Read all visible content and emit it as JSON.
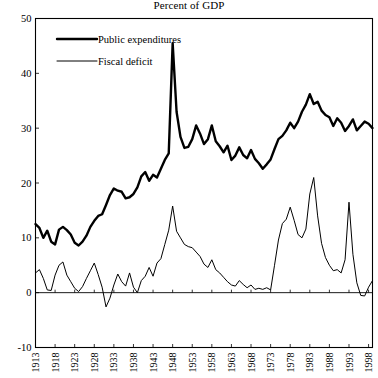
{
  "chart_data": {
    "type": "line",
    "title": "Percent of GDP",
    "xlabel": "",
    "ylabel": "",
    "ylim": [
      -10,
      50
    ],
    "xlim": [
      1913,
      1999
    ],
    "yticks": [
      50,
      40,
      30,
      20,
      10,
      0,
      -10
    ],
    "xticks": [
      1913,
      1918,
      1923,
      1928,
      1933,
      1938,
      1943,
      1948,
      1953,
      1958,
      1963,
      1968,
      1973,
      1978,
      1983,
      1988,
      1993,
      1998
    ],
    "grid": false,
    "zero_line": true,
    "legend_position": "top-left",
    "legend": [
      "Public expenditures",
      "Fiscal deficit"
    ],
    "x": [
      1913,
      1914,
      1915,
      1916,
      1917,
      1918,
      1919,
      1920,
      1921,
      1922,
      1923,
      1924,
      1925,
      1926,
      1927,
      1928,
      1929,
      1930,
      1931,
      1932,
      1933,
      1934,
      1935,
      1936,
      1937,
      1938,
      1939,
      1940,
      1941,
      1942,
      1943,
      1944,
      1945,
      1946,
      1947,
      1948,
      1949,
      1950,
      1951,
      1952,
      1953,
      1954,
      1955,
      1956,
      1957,
      1958,
      1959,
      1960,
      1961,
      1962,
      1963,
      1964,
      1965,
      1966,
      1967,
      1968,
      1969,
      1970,
      1971,
      1972,
      1973,
      1974,
      1975,
      1976,
      1977,
      1978,
      1979,
      1980,
      1981,
      1982,
      1983,
      1984,
      1985,
      1986,
      1987,
      1988,
      1989,
      1990,
      1991,
      1992,
      1993,
      1994,
      1995,
      1996,
      1997,
      1998,
      1999
    ],
    "series": [
      {
        "name": "Public expenditures",
        "style": "thick",
        "values": [
          12.5,
          11.8,
          10.0,
          11.3,
          9.3,
          8.8,
          11.5,
          12.0,
          11.4,
          10.6,
          9.1,
          8.6,
          9.3,
          10.4,
          12.0,
          13.1,
          14.0,
          14.3,
          16.0,
          17.8,
          19.0,
          18.6,
          18.4,
          17.2,
          17.4,
          18.0,
          19.2,
          21.2,
          22.0,
          20.4,
          21.5,
          21.0,
          22.6,
          24.2,
          25.4,
          45.5,
          33.0,
          28.4,
          26.4,
          26.6,
          28.0,
          30.5,
          29.0,
          27.1,
          28.0,
          30.5,
          27.6,
          26.7,
          25.6,
          26.8,
          24.2,
          25.0,
          26.5,
          25.1,
          24.5,
          26.0,
          24.4,
          23.6,
          22.6,
          23.4,
          24.3,
          26.2,
          28.0,
          28.6,
          29.6,
          31.0,
          30.0,
          31.2,
          33.0,
          34.3,
          36.2,
          34.4,
          34.8,
          33.2,
          32.4,
          32.0,
          30.4,
          31.8,
          31.0,
          29.5,
          30.4,
          31.6,
          29.6,
          30.4,
          31.2,
          30.8,
          30.0
        ]
      },
      {
        "name": "Fiscal deficit",
        "style": "thin",
        "values": [
          3.6,
          4.2,
          2.6,
          0.5,
          0.4,
          3.2,
          5.0,
          5.6,
          3.2,
          2.0,
          0.8,
          0.2,
          1.1,
          2.6,
          4.0,
          5.4,
          3.3,
          1.0,
          -2.6,
          -1.0,
          1.4,
          3.4,
          2.0,
          1.2,
          3.6,
          1.0,
          0.0,
          2.2,
          3.0,
          4.6,
          3.0,
          5.4,
          6.2,
          8.8,
          11.4,
          15.8,
          11.2,
          10.0,
          8.8,
          8.4,
          8.2,
          7.4,
          6.6,
          5.2,
          4.6,
          6.0,
          4.2,
          3.6,
          2.8,
          2.0,
          1.4,
          1.2,
          2.2,
          1.5,
          0.9,
          1.4,
          0.6,
          0.8,
          0.6,
          0.9,
          0.5,
          5.0,
          9.6,
          12.6,
          13.4,
          15.6,
          13.2,
          10.6,
          10.0,
          11.6,
          18.0,
          21.0,
          14.0,
          9.0,
          6.4,
          5.0,
          4.0,
          4.2,
          3.6,
          6.0,
          16.5,
          7.0,
          1.8,
          -0.5,
          -0.6,
          1.0,
          2.2
        ]
      }
    ]
  },
  "legend": {
    "items": [
      {
        "label": "Public expenditures",
        "style": "thick"
      },
      {
        "label": "Fiscal deficit",
        "style": "thin"
      }
    ]
  },
  "axes": {
    "y_labels": [
      "50",
      "40",
      "30",
      "20",
      "10",
      "0",
      "-10"
    ],
    "x_labels": [
      "1913",
      "1918",
      "1923",
      "1928",
      "1933",
      "1938",
      "1943",
      "1948",
      "1953",
      "1958",
      "1963",
      "1968",
      "1973",
      "1978",
      "1983",
      "1988",
      "1993",
      "1998"
    ]
  }
}
